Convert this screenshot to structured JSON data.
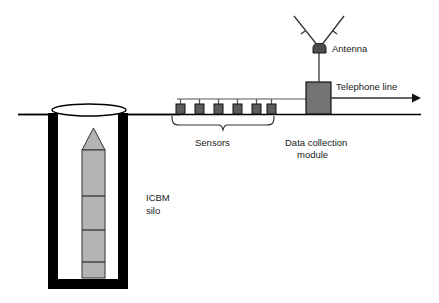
{
  "diagram": {
    "background_color": "#ffffff",
    "ground_line": {
      "label": "ground-surface-line",
      "y": 114,
      "x_start": 18,
      "x_end": 421,
      "color": "#000000"
    },
    "labels": {
      "antenna": "Antenna",
      "telephone_line": "Telephone line",
      "sensors": "Sensors",
      "data_collection_module_line1": "Data collection",
      "data_collection_module_line2": "module",
      "icbm_line1": "ICBM",
      "icbm_line2": "silo"
    },
    "colors": {
      "outline": "#000000",
      "silo_wall": "#000000",
      "missile_body": "#b3b3b3",
      "module_fill": "#737373",
      "sensor_fill": "#5c5c5c",
      "antenna_fill": "#4d4d4d",
      "text": "#1a1a1a",
      "wire": "#555555"
    },
    "components": {
      "antenna": {
        "name": "antenna",
        "element_x": 313,
        "element_y": 44,
        "element_width": 13,
        "element_height": 9,
        "mast_x": 319,
        "mast_top": 53,
        "mast_bottom": 82,
        "left_arm_end_x": 294,
        "left_arm_end_y": 16,
        "right_arm_end_x": 344,
        "right_arm_end_y": 16
      },
      "data_collection_module": {
        "name": "data-collection-module",
        "x": 306,
        "y": 82,
        "width": 25,
        "height": 32
      },
      "telephone_line": {
        "name": "telephone-line",
        "y": 98,
        "x_start": 331,
        "x_end": 418,
        "arrow": "right"
      },
      "sensor_bus": {
        "name": "sensor-bus-wire",
        "y": 99,
        "x_start": 177,
        "x_end": 306
      },
      "sensors": {
        "name": "sensor-array",
        "count": 6,
        "box_width": 9,
        "box_height": 10,
        "box_top": 104,
        "x_positions": [
          176,
          195,
          214,
          233,
          252,
          267
        ]
      },
      "sensor_brace": {
        "name": "sensors-brace",
        "x_start": 172,
        "x_end": 274,
        "y_top": 118,
        "y_bottom": 130
      },
      "silo": {
        "name": "icbm-silo",
        "outer_x": 48,
        "outer_y": 113,
        "outer_width": 80,
        "outer_height": 176,
        "wall_thickness": 10,
        "cap_cx": 89,
        "cap_cy": 110,
        "cap_rx": 37,
        "cap_ry": 6
      },
      "missile": {
        "name": "icbm-missile",
        "x": 82,
        "width": 23,
        "nose_top_y": 128,
        "body_top_y": 150,
        "body_bottom_y": 278,
        "segment_divider_y": [
          196,
          230,
          262
        ]
      }
    },
    "label_positions": {
      "antenna": {
        "x": 332,
        "y": 52
      },
      "telephone_line": {
        "x": 336,
        "y": 89
      },
      "sensors": {
        "x": 195,
        "y": 145
      },
      "data_collection_module_line1": {
        "x": 285,
        "y": 145
      },
      "data_collection_module_line2": {
        "x": 296,
        "y": 157
      },
      "icbm_line1": {
        "x": 146,
        "y": 201
      },
      "icbm_line2": {
        "x": 146,
        "y": 214
      }
    }
  }
}
